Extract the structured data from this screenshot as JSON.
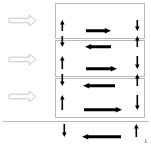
{
  "figure": {
    "title": "",
    "canvas": {
      "width": 151,
      "height": 147,
      "background": "#ffffff"
    },
    "colors": {
      "arrow_fill": "#000000",
      "box_border": "#b9b9b9",
      "baseline": "#bcbcbc",
      "hollow_arrow_stroke": "#c8c8c8",
      "hollow_arrow_fill": "#ffffff"
    }
  },
  "entry_arrows": [
    {
      "name": "entry-arrow-1",
      "direction": "right",
      "style": "hollow",
      "x": 9,
      "y": 15,
      "width": 27,
      "height": 11
    },
    {
      "name": "entry-arrow-2",
      "direction": "right",
      "style": "hollow",
      "x": 9,
      "y": 54,
      "width": 27,
      "height": 11
    },
    {
      "name": "entry-arrow-3",
      "direction": "right",
      "style": "hollow",
      "x": 9,
      "y": 91,
      "width": 27,
      "height": 11
    }
  ],
  "boxes": [
    {
      "name": "box-1",
      "index": 1,
      "x": 55,
      "y": 3,
      "width": 90,
      "height": 36
    },
    {
      "name": "box-2",
      "index": 2,
      "x": 55,
      "y": 40,
      "width": 90,
      "height": 37
    },
    {
      "name": "box-3",
      "index": 3,
      "x": 55,
      "y": 78,
      "width": 90,
      "height": 40
    }
  ],
  "baseline": {
    "name": "baseline",
    "x": 3,
    "y": 121,
    "width": 146
  },
  "arrow_rows": [
    {
      "name": "row-1",
      "box": 1,
      "y": 31,
      "arrows": [
        {
          "name": "arrow-up",
          "direction": "up",
          "x": 62,
          "length": 11
        },
        {
          "name": "arrow-right",
          "direction": "right",
          "x": 86,
          "length": 25
        },
        {
          "name": "arrow-down",
          "direction": "down",
          "x": 137,
          "length": 11
        }
      ]
    },
    {
      "name": "row-2",
      "box": 2,
      "y": 47,
      "arrows": [
        {
          "name": "arrow-down",
          "direction": "down",
          "x": 62,
          "length": 11
        },
        {
          "name": "arrow-left",
          "direction": "left",
          "x": 85,
          "length": 26
        },
        {
          "name": "arrow-up",
          "direction": "up",
          "x": 137,
          "length": 11
        }
      ]
    },
    {
      "name": "row-3",
      "box": 2,
      "y": 69,
      "arrows": [
        {
          "name": "arrow-up",
          "direction": "up",
          "x": 62,
          "length": 13
        },
        {
          "name": "arrow-right",
          "direction": "right",
          "x": 86,
          "length": 31
        },
        {
          "name": "arrow-down",
          "direction": "down",
          "x": 137,
          "length": 13
        }
      ]
    },
    {
      "name": "row-4",
      "box": 3,
      "y": 86,
      "arrows": [
        {
          "name": "arrow-down",
          "direction": "down",
          "x": 62,
          "length": 12
        },
        {
          "name": "arrow-left",
          "direction": "left",
          "x": 83,
          "length": 32
        },
        {
          "name": "arrow-up",
          "direction": "up",
          "x": 137,
          "length": 12
        }
      ]
    },
    {
      "name": "row-5",
      "box": 3,
      "y": 110,
      "arrows": [
        {
          "name": "arrow-up",
          "direction": "up",
          "x": 62,
          "length": 15
        },
        {
          "name": "arrow-right",
          "direction": "right",
          "x": 84,
          "length": 38
        },
        {
          "name": "arrow-down",
          "direction": "down",
          "x": 137,
          "length": 15
        }
      ]
    },
    {
      "name": "row-6",
      "box": 0,
      "y": 137,
      "arrows": [
        {
          "name": "arrow-down",
          "direction": "down",
          "x": 64,
          "length": 13
        },
        {
          "name": "arrow-left",
          "direction": "left",
          "x": 82,
          "length": 39
        },
        {
          "name": "arrow-up",
          "direction": "up",
          "x": 136,
          "length": 13
        }
      ]
    }
  ],
  "labels": [
    {
      "name": "index-label-1",
      "text": "1",
      "x": 144,
      "y": 138
    }
  ]
}
